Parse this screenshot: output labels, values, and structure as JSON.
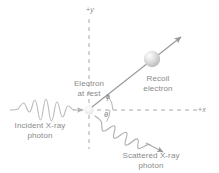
{
  "figure": {
    "type": "physics-diagram",
    "background_color": "#ffffff",
    "stroke_color": "#9a9a9a",
    "text_color": "#8a8a8a"
  },
  "axes": {
    "y_label": "+y",
    "y_sign": "+",
    "y_name": "y",
    "x_label": "+x",
    "x_sign": "+",
    "x_name": "x",
    "style": "dashed",
    "origin": "electron-at-rest"
  },
  "angles": {
    "phi": "ϕ",
    "theta": "θ"
  },
  "labels": {
    "incident_line1": "Incident X-ray",
    "incident_line2": "photon",
    "electron_line1": "Electron",
    "electron_line2": "at rest",
    "recoil_line1": "Recoil",
    "recoil_line2": "electron",
    "scattered_line1": "Scattered X-ray",
    "scattered_line2": "photon"
  },
  "elements": {
    "incident_wave": "incident-xray-wave",
    "scattered_wave": "scattered-xray-wave",
    "recoil_arrow": "recoil-electron-arrow",
    "electron_sphere": "recoil-electron-sphere",
    "rest_electron_sphere": "electron-at-rest-sphere"
  },
  "geometry": {
    "recoil_angle_deg": 40,
    "scatter_angle_deg": 33
  }
}
